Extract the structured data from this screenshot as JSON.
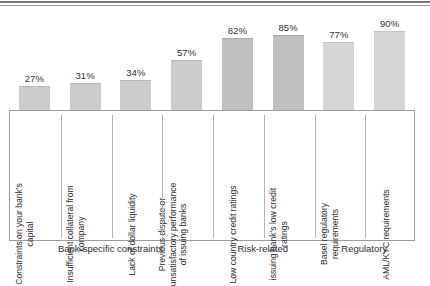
{
  "chart_data": {
    "type": "bar",
    "title": "",
    "subtitle": "",
    "xlabel": "",
    "ylabel": "",
    "ylim": [
      0,
      100
    ],
    "grid": false,
    "legend": "none",
    "orientation": "vertical",
    "value_label_suffix": "%",
    "categories": [
      "Constraints on your bank's capital",
      "Insufficient collateral from company",
      "Lack of dollar liquidity",
      "Previous dispute or unsatisfactory performance of issuing banks",
      "Low country credit ratings",
      "issuing bank's low credit ratings",
      "Basel regulatory requirements",
      "AML/KYC requirements"
    ],
    "values": [
      27,
      31,
      34,
      57,
      82,
      85,
      77,
      90
    ],
    "value_labels": [
      "27%",
      "31%",
      "34%",
      "57%",
      "82%",
      "85%",
      "77%",
      "90%"
    ],
    "groups": [
      {
        "label": "Bank-specific constraints",
        "bar_indices": [
          0,
          1,
          2,
          3
        ]
      },
      {
        "label": "Risk-related",
        "bar_indices": [
          4,
          5
        ]
      },
      {
        "label": "Regulatory",
        "bar_indices": [
          6,
          7
        ]
      }
    ],
    "bar_colors": [
      "#cccccc",
      "#cccccc",
      "#cccccc",
      "#cccccc",
      "#c0c0c0",
      "#c0c0c0",
      "#d6d6d6",
      "#d6d6d6"
    ]
  },
  "bars": [
    {
      "value_label": "27%",
      "category_lines": [
        "Constraints on your bank's",
        "capital"
      ],
      "shade": "shade-plain"
    },
    {
      "value_label": "31%",
      "category_lines": [
        "Insufficient collateral from",
        "company"
      ],
      "shade": "shade-plain"
    },
    {
      "value_label": "34%",
      "category_lines": [
        "Lack of dollar liquidity"
      ],
      "shade": "shade-plain"
    },
    {
      "value_label": "57%",
      "category_lines": [
        "Previous dispute or",
        "unsatisfactory performance",
        "of issuing banks"
      ],
      "shade": "shade-plain"
    },
    {
      "value_label": "82%",
      "category_lines": [
        "Low country credit ratings"
      ],
      "shade": "shade-dark"
    },
    {
      "value_label": "85%",
      "category_lines": [
        "issuing bank's low credit",
        "ratings"
      ],
      "shade": "shade-dark"
    },
    {
      "value_label": "77%",
      "category_lines": [
        "Basel regulatory",
        "requirements"
      ],
      "shade": "shade-light"
    },
    {
      "value_label": "90%",
      "category_lines": [
        "AML/KYC requirements"
      ],
      "shade": "shade-light"
    }
  ],
  "groups": [
    {
      "label": "Bank-specific constraints"
    },
    {
      "label": "Risk-related"
    },
    {
      "label": "Regulatory"
    }
  ]
}
